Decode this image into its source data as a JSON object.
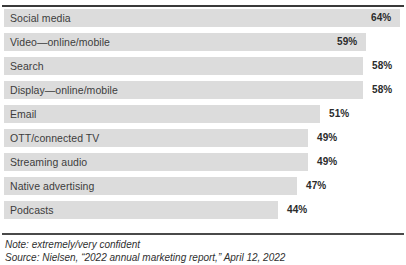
{
  "top_bleed_text": "",
  "chart_data": {
    "type": "bar",
    "orientation": "horizontal",
    "title": "",
    "xlabel": "",
    "ylabel": "",
    "grid": false,
    "legend": false,
    "value_suffix": "%",
    "xlim": [
      0,
      70
    ],
    "categories": [
      "Social media",
      "Video—online/mobile",
      "Search",
      "Display—online/mobile",
      "Email",
      "OTT/connected TV",
      "Streaming audio",
      "Native advertising",
      "Podcasts"
    ],
    "values": [
      64,
      59,
      58,
      58,
      51,
      49,
      49,
      47,
      44
    ],
    "value_labels": [
      "64%",
      "59%",
      "58%",
      "58%",
      "51%",
      "49%",
      "49%",
      "47%",
      "44%"
    ],
    "bar_color": "#dcdcdc",
    "label_color": "#3d3d3d",
    "bars": [
      {
        "category": "Social media",
        "value": 64,
        "label": "64%",
        "bar_end_px": 400,
        "label_left_px": 371,
        "label_inside": true
      },
      {
        "category": "Video—online/mobile",
        "value": 59,
        "label": "59%",
        "bar_end_px": 366,
        "label_left_px": 337,
        "label_inside": true
      },
      {
        "category": "Search",
        "value": 58,
        "label": "58%",
        "bar_end_px": 363,
        "label_left_px": 372,
        "label_inside": false
      },
      {
        "category": "Display—online/mobile",
        "value": 58,
        "label": "58%",
        "bar_end_px": 363,
        "label_left_px": 372,
        "label_inside": false
      },
      {
        "category": "Email",
        "value": 51,
        "label": "51%",
        "bar_end_px": 320,
        "label_left_px": 329,
        "label_inside": false
      },
      {
        "category": "OTT/connected TV",
        "value": 49,
        "label": "49%",
        "bar_end_px": 308,
        "label_left_px": 317,
        "label_inside": false
      },
      {
        "category": "Streaming audio",
        "value": 49,
        "label": "49%",
        "bar_end_px": 308,
        "label_left_px": 317,
        "label_inside": false
      },
      {
        "category": "Native advertising",
        "value": 47,
        "label": "47%",
        "bar_end_px": 297,
        "label_left_px": 306,
        "label_inside": false
      },
      {
        "category": "Podcasts",
        "value": 44,
        "label": "44%",
        "bar_end_px": 278,
        "label_left_px": 287,
        "label_inside": false
      }
    ]
  },
  "footer": {
    "note": "Note: extremely/very confident",
    "source": "Source: Nielsen, “2022 annual marketing report,” April 12, 2022"
  }
}
